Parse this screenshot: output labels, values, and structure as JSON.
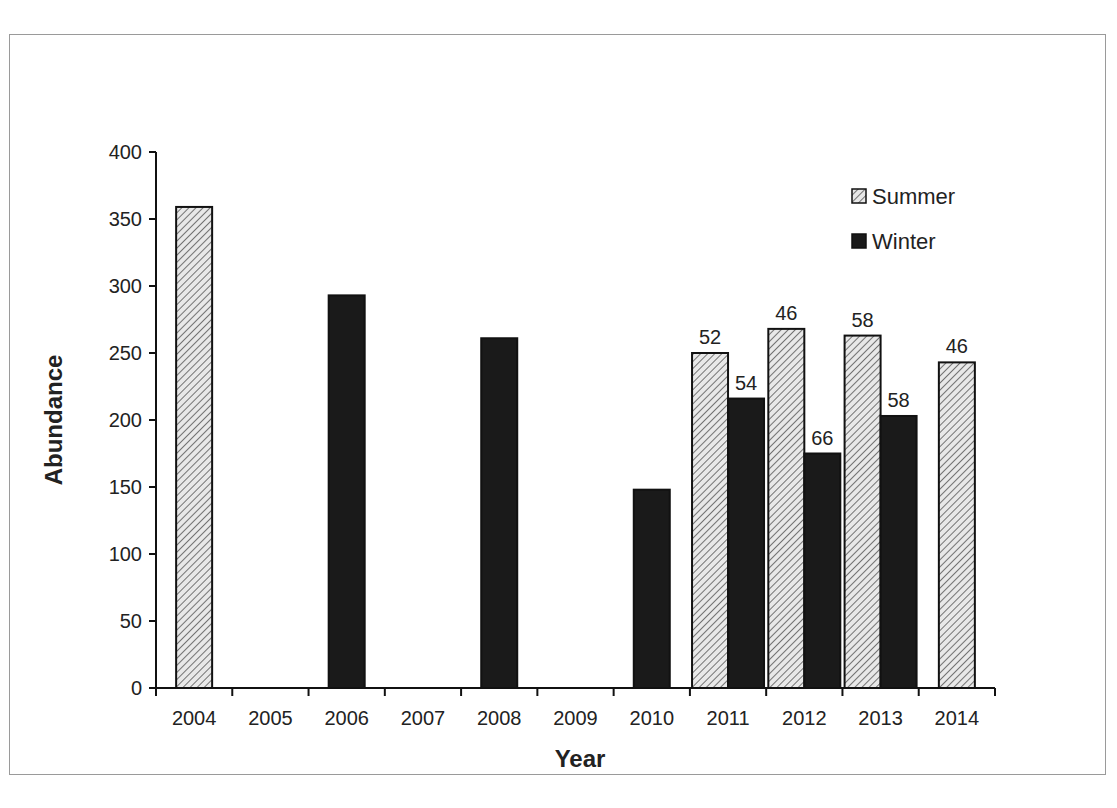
{
  "chart_data": {
    "type": "bar",
    "title": "",
    "xlabel": "Year",
    "ylabel": "Abundance",
    "ylim": [
      0,
      400
    ],
    "yticks": [
      0,
      50,
      100,
      150,
      200,
      250,
      300,
      350,
      400
    ],
    "grid": false,
    "legend_position": "upper right",
    "categories": [
      "2004",
      "2005",
      "2006",
      "2007",
      "2008",
      "2009",
      "2010",
      "2011",
      "2012",
      "2013",
      "2014"
    ],
    "series": [
      {
        "name": "Summer",
        "pattern": "hatched",
        "values": [
          359,
          null,
          null,
          null,
          null,
          null,
          null,
          250,
          268,
          263,
          243
        ],
        "labels": [
          null,
          null,
          null,
          null,
          null,
          null,
          null,
          "52",
          "46",
          "58",
          "46"
        ]
      },
      {
        "name": "Winter",
        "pattern": "solid",
        "color": "#1a1a1a",
        "values": [
          null,
          null,
          293,
          null,
          261,
          null,
          148,
          216,
          175,
          203,
          null
        ],
        "labels": [
          null,
          null,
          null,
          null,
          null,
          null,
          null,
          "54",
          "66",
          "58",
          null
        ]
      }
    ]
  }
}
